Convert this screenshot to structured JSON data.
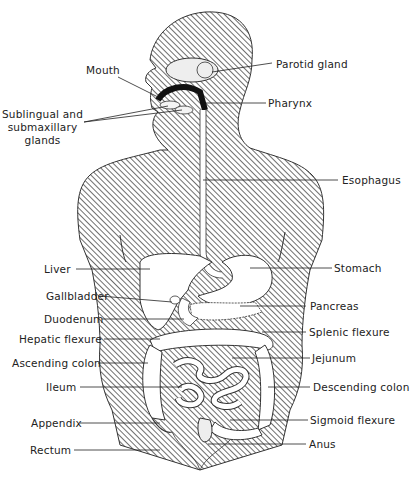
{
  "figure": {
    "colors": {
      "ink": "#222222",
      "hatch": "#4a4a4a",
      "organ_fill": "#ffffff",
      "background": "#ffffff"
    }
  },
  "labels_left": [
    {
      "id": "mouth",
      "text": "Mouth"
    },
    {
      "id": "sublingual",
      "text": "Sublingual and\nsubmaxillary\nglands"
    },
    {
      "id": "liver",
      "text": "Liver"
    },
    {
      "id": "gallbladder",
      "text": "Gallbladder"
    },
    {
      "id": "duodenum",
      "text": "Duodenum"
    },
    {
      "id": "hepatic-flexure",
      "text": "Hepatic flexure"
    },
    {
      "id": "ascending-colon",
      "text": "Ascending colon"
    },
    {
      "id": "ileum",
      "text": "Ileum"
    },
    {
      "id": "appendix",
      "text": "Appendix"
    },
    {
      "id": "rectum",
      "text": "Rectum"
    }
  ],
  "labels_right": [
    {
      "id": "parotid-gland",
      "text": "Parotid gland"
    },
    {
      "id": "pharynx",
      "text": "Pharynx"
    },
    {
      "id": "esophagus",
      "text": "Esophagus"
    },
    {
      "id": "stomach",
      "text": "Stomach"
    },
    {
      "id": "pancreas",
      "text": "Pancreas"
    },
    {
      "id": "splenic-flexure",
      "text": "Splenic flexure"
    },
    {
      "id": "jejunum",
      "text": "Jejunum"
    },
    {
      "id": "descending-colon",
      "text": "Descending colon"
    },
    {
      "id": "sigmoid-flexure",
      "text": "Sigmoid flexure"
    },
    {
      "id": "anus",
      "text": "Anus"
    }
  ]
}
